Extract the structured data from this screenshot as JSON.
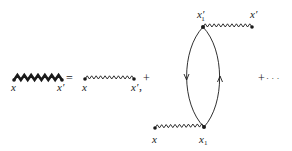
{
  "diagram": {
    "lhs": {
      "line_type": "thick-wavy",
      "label_start": "x",
      "label_end": "x′"
    },
    "equals": "=",
    "term1": {
      "line_type": "thin-wavy",
      "label_start": "x",
      "label_end": "x′",
      "trailing": ","
    },
    "plus1": "+",
    "term2": {
      "top_vertex": {
        "label": "x",
        "prime": "′",
        "subscript": "1"
      },
      "top_external": {
        "label": "x′"
      },
      "bottom_vertex": {
        "label": "x",
        "subscript": "1"
      },
      "bottom_external": {
        "label": "x"
      },
      "loop": {
        "left_arrow": "down",
        "right_arrow": "up"
      }
    },
    "plus2": "+",
    "ellipsis": "· · ·",
    "colors": {
      "ink": "#1a1a1a",
      "background": "#ffffff"
    }
  }
}
